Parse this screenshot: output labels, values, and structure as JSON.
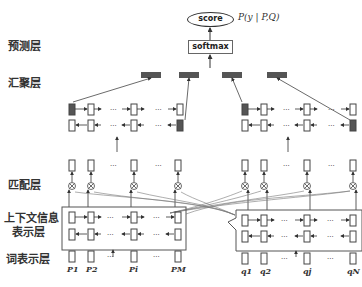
{
  "layers": {
    "prediction": "预测层",
    "aggregation": "汇聚层",
    "matching": "匹配层",
    "context_line1": "上下文信息",
    "context_line2": "表示层",
    "word": "词表示层"
  },
  "output": {
    "score_label": "score",
    "formula": "P(y | P,Q)",
    "softmax_label": "softmax"
  },
  "sequences": {
    "passage_tokens": [
      "P1",
      "P2",
      "Pi",
      "PM"
    ],
    "question_tokens": [
      "q1",
      "q2",
      "qj",
      "qN"
    ],
    "ellipsis": "..."
  },
  "colors": {
    "line": "#444444",
    "filled_cell": "#555555",
    "box_stroke": "#666666"
  }
}
